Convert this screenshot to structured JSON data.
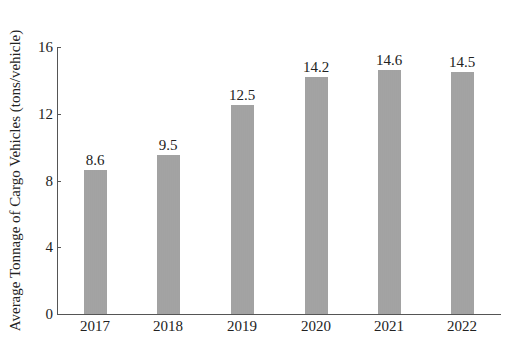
{
  "chart_data": {
    "type": "bar",
    "title": "",
    "xlabel": "",
    "ylabel": "Average Tonnage of Cargo Vehicles (tons/vehicle)",
    "categories": [
      "2017",
      "2018",
      "2019",
      "2020",
      "2021",
      "2022"
    ],
    "values": [
      8.6,
      9.5,
      12.5,
      14.2,
      14.6,
      14.5
    ],
    "data_labels": [
      "8.6",
      "9.5",
      "12.5",
      "14.2",
      "14.6",
      "14.5"
    ],
    "ylim": [
      0,
      16
    ],
    "yticks": [
      0,
      4,
      8,
      12,
      16
    ],
    "ytick_labels": [
      "0",
      "4",
      "8",
      "12",
      "16"
    ],
    "grid": false,
    "legend": null,
    "bar_color": "#a0a0a0"
  }
}
